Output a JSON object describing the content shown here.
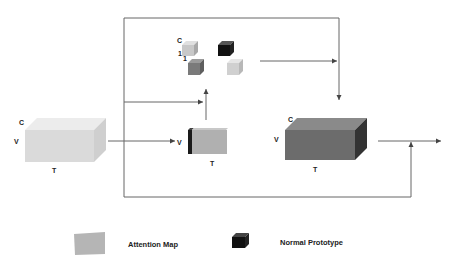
{
  "input_tensor": {
    "c_label": "C",
    "v_label": "V",
    "t_label": "T"
  },
  "prototypes": {
    "c_label": "C",
    "one_label_a": "1",
    "one_label_b": "1"
  },
  "attention_map": {
    "v_label": "V",
    "t_label": "T"
  },
  "output_tensor": {
    "c_label": "C",
    "v_label": "V",
    "t_label": "T"
  },
  "legend": {
    "attention_map_label": "Attention Map",
    "normal_prototype_label": "Normal Prototype"
  },
  "colors": {
    "input_block": "#dcdcdc",
    "output_block": "#6e6e6e",
    "attention_map": "#b4b4b4",
    "normal_prototype": "#111111",
    "lines": "#555555"
  }
}
